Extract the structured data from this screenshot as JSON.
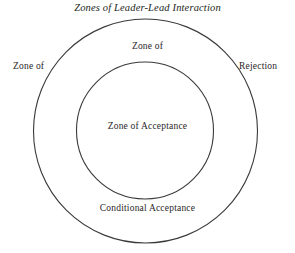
{
  "diagram": {
    "title": "Zones of Leader-Lead Interaction",
    "stroke_color": "#3a3a3a",
    "background_color": "#ffffff",
    "text_color": "#2a2628",
    "labels": {
      "outer_left": "Zone of",
      "outer_right": "Rejection",
      "ring_top": "Zone of",
      "ring_bottom": "Conditional Acceptance",
      "core": "Zone of Acceptance"
    },
    "circles": {
      "outer": {
        "cx": 145.5,
        "cy": 131,
        "r": 112
      },
      "inner": {
        "cx": 145,
        "cy": 130.5,
        "r": 68.5
      }
    }
  }
}
